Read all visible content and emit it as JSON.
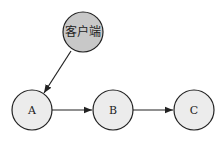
{
  "diagram": {
    "nodes": [
      {
        "id": "client",
        "label": "客户端",
        "fill": "#c8c8c8"
      },
      {
        "id": "A",
        "label": "A",
        "fill": "#ececec"
      },
      {
        "id": "B",
        "label": "B",
        "fill": "#ececec"
      },
      {
        "id": "C",
        "label": "C",
        "fill": "#ececec"
      }
    ],
    "edges": [
      {
        "from": "client",
        "to": "A"
      },
      {
        "from": "A",
        "to": "B"
      },
      {
        "from": "B",
        "to": "C"
      }
    ],
    "stroke_color": "#222222"
  }
}
